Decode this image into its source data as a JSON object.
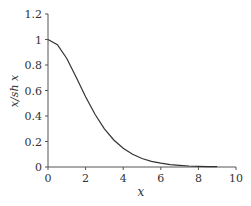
{
  "chart_data": {
    "type": "line",
    "title": "",
    "xlabel": "x",
    "ylabel": "x/sh x",
    "xlim": [
      0,
      10
    ],
    "ylim": [
      0,
      1.2
    ],
    "grid": false,
    "legend": null,
    "x_ticks": [
      "0",
      "2",
      "4",
      "6",
      "8",
      "10"
    ],
    "y_ticks": [
      "0",
      "0.2",
      "0.4",
      "0.6",
      "0.8",
      "1",
      "1.2"
    ],
    "series": [
      {
        "name": "x/sh x",
        "x": [
          0,
          0.5,
          1,
          1.5,
          2,
          2.5,
          3,
          3.5,
          4,
          4.5,
          5,
          5.5,
          6,
          6.5,
          7,
          7.5,
          8,
          8.5,
          9
        ],
        "values": [
          1.0,
          0.96,
          0.851,
          0.704,
          0.551,
          0.413,
          0.299,
          0.212,
          0.147,
          0.1,
          0.067,
          0.045,
          0.03,
          0.019,
          0.013,
          0.008,
          0.005,
          0.003,
          0.002
        ]
      }
    ]
  }
}
